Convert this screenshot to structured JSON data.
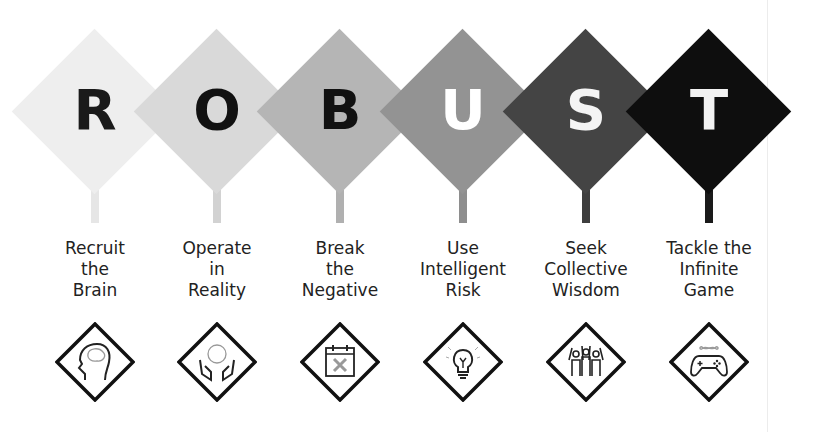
{
  "title_acronym": "ROBUST",
  "steps": [
    {
      "letter": "R",
      "lines": [
        "Recruit",
        "the",
        "Brain"
      ],
      "icon": "brain-head-icon",
      "fill": "#eeeeee",
      "letter_color": "#1a1a1a"
    },
    {
      "letter": "O",
      "lines": [
        "Operate",
        "in",
        "Reality"
      ],
      "icon": "hands-globe-icon",
      "fill": "#d9d9d9",
      "letter_color": "#111111"
    },
    {
      "letter": "B",
      "lines": [
        "Break",
        "the",
        "Negative"
      ],
      "icon": "calendar-x-icon",
      "fill": "#b5b5b5",
      "letter_color": "#111111"
    },
    {
      "letter": "U",
      "lines": [
        "Use",
        "Intelligent",
        "Risk"
      ],
      "icon": "lightbulb-icon",
      "fill": "#939393",
      "letter_color": "#ffffff"
    },
    {
      "letter": "S",
      "lines": [
        "Seek",
        "Collective",
        "Wisdom"
      ],
      "icon": "group-people-icon",
      "fill": "#444444",
      "letter_color": "#f4f4f4"
    },
    {
      "letter": "T",
      "lines": [
        "Tackle the",
        "Infinite",
        "Game"
      ],
      "icon": "game-controller-infinity-icon",
      "fill": "#0e0e0e",
      "letter_color": "#f2f2f2"
    }
  ]
}
